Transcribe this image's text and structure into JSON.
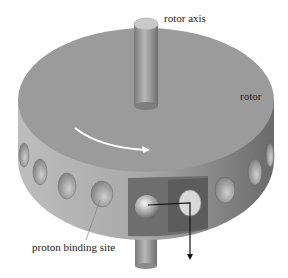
{
  "diagram": {
    "labels": {
      "rotor_axis": "rotor axis",
      "rotor": "rotor",
      "proton_binding_site": "proton binding site"
    },
    "colors": {
      "rotor_top": "#9a9a9a",
      "rotor_side": "#a4a4a4",
      "stator": "#6e6e6e",
      "axis": "#8c8c8c",
      "arrow": "#ffffff",
      "proton_path": "#111111"
    }
  }
}
